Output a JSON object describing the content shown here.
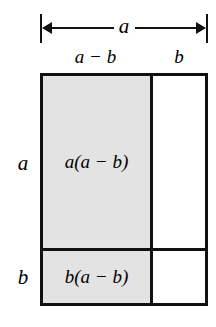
{
  "figure": {
    "dimension_arrow": {
      "name": "total-width-arrow",
      "label": "a"
    },
    "column_captions": [
      {
        "name": "column-caption-left",
        "label": "a − b"
      },
      {
        "name": "column-caption-right",
        "label": "b"
      }
    ],
    "row_captions": [
      {
        "name": "row-caption-upper",
        "label": "a"
      },
      {
        "name": "row-caption-lower",
        "label": "b"
      }
    ],
    "cells": [
      {
        "name": "cell-top-left",
        "label": "a(a − b)",
        "shaded": true
      },
      {
        "name": "cell-bottom-left",
        "label": "b(a − b)",
        "shaded": true
      },
      {
        "name": "cell-top-right",
        "label": "",
        "shaded": false
      },
      {
        "name": "cell-bottom-right",
        "label": "",
        "shaded": false
      }
    ],
    "colors": {
      "shaded_fill": "#e3e3e3",
      "unshaded_fill": "#ffffff",
      "stroke": "#111111",
      "background": "#ffffff"
    }
  }
}
